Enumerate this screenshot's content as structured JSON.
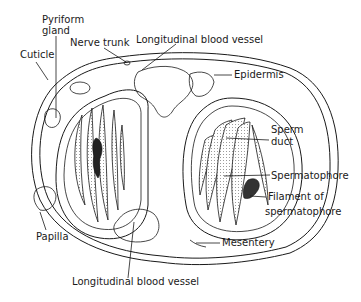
{
  "diagram": {
    "labels": {
      "pyriform_gland_1": "Pyriform",
      "pyriform_gland_2": "gland",
      "cuticle": "Cuticle",
      "nerve_trunk": "Nerve trunk",
      "longitudinal_vessel_top": "Longitudinal blood vessel",
      "epidermis": "Epidermis",
      "sperm_duct_1": "Sperm",
      "sperm_duct_2": "duct",
      "spermatophore": "Spermatophore",
      "filament_1": "Filament of",
      "filament_2": "spermatophore",
      "papilla": "Papilla",
      "mesentery": "Mesentery",
      "longitudinal_vessel_bottom": "Longitudinal blood vessel"
    },
    "colors": {
      "line": "#1a1a1a",
      "background": "#ffffff"
    }
  }
}
